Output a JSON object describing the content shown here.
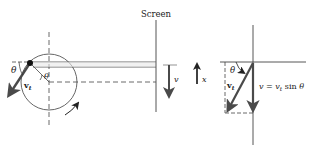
{
  "labels": {
    "screen": "Screen",
    "theta_left_outer": "θ",
    "theta_left_inner": "θ",
    "vt_left": "v",
    "vt_left_sub": "t",
    "v_screen": "v",
    "x_axis": "x",
    "theta_right": "θ",
    "vt_right": "v",
    "vt_right_sub": "t",
    "equation_lhs": "v",
    "equation_eq": " = ",
    "equation_rhs_v": "v",
    "equation_rhs_sub": "t",
    "equation_rhs_func": " sin ",
    "equation_rhs_theta": "θ"
  },
  "colors": {
    "line": "#333333",
    "arrow": "#4a4a4a",
    "dashed": "#444444",
    "text": "#222222"
  }
}
